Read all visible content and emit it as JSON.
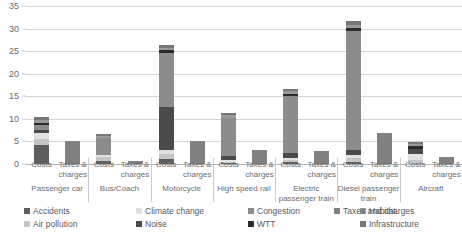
{
  "chart_data": {
    "type": "bar",
    "subtype": "stacked-bar-grouped",
    "title": "",
    "xlabel": "",
    "ylabel": "",
    "ylim": [
      0,
      35
    ],
    "yticks": [
      0,
      5,
      10,
      15,
      20,
      25,
      30,
      35
    ],
    "ytick_labels": [
      "0",
      "5",
      "10",
      "15",
      "20",
      "25",
      "30",
      "35"
    ],
    "grid": true,
    "legend_position": "bottom",
    "bar_sublabels": [
      "Costs",
      "Taxes & charges"
    ],
    "categories": [
      "Passenger car",
      "Bus/Coach",
      "Motorcycle",
      "High speed rail",
      "Electric passenger train",
      "Diesel passenger train",
      "Aircraft"
    ],
    "series": [
      {
        "name": "Accidents",
        "color": "#5e5e5e"
      },
      {
        "name": "Air pollution",
        "color": "#c6c6c6"
      },
      {
        "name": "Climate change",
        "color": "#e2e2e2"
      },
      {
        "name": "Noise",
        "color": "#4a4a4a"
      },
      {
        "name": "Congestion",
        "color": "#8c8c8c"
      },
      {
        "name": "WTT",
        "color": "#2b2b2b"
      },
      {
        "name": "Habitat",
        "color": "#9a9a9a"
      },
      {
        "name": "Infrastructure",
        "color": "#777777"
      },
      {
        "name": "Taxes and charges",
        "color": "#808080"
      }
    ],
    "bars": [
      {
        "category": "Passenger car",
        "kind": "Costs",
        "total": 10.4,
        "stack": [
          {
            "series": "Accidents",
            "value": 4.2
          },
          {
            "series": "Air pollution",
            "value": 1.4
          },
          {
            "series": "Climate change",
            "value": 1.3
          },
          {
            "series": "Noise",
            "value": 0.7
          },
          {
            "series": "Congestion",
            "value": 1.1
          },
          {
            "series": "WTT",
            "value": 0.5
          },
          {
            "series": "Habitat",
            "value": 0.6
          },
          {
            "series": "Infrastructure",
            "value": 0.6
          }
        ]
      },
      {
        "category": "Passenger car",
        "kind": "Taxes & charges",
        "total": 5.2,
        "stack": [
          {
            "series": "Taxes and charges",
            "value": 5.2
          }
        ]
      },
      {
        "category": "Bus/Coach",
        "kind": "Costs",
        "total": 6.7,
        "stack": [
          {
            "series": "Accidents",
            "value": 0.6
          },
          {
            "series": "Air pollution",
            "value": 1.0
          },
          {
            "series": "Climate change",
            "value": 0.5
          },
          {
            "series": "Congestion",
            "value": 3.6
          },
          {
            "series": "Habitat",
            "value": 0.5
          },
          {
            "series": "Infrastructure",
            "value": 0.5
          }
        ]
      },
      {
        "category": "Bus/Coach",
        "kind": "Taxes & charges",
        "total": 0.7,
        "stack": [
          {
            "series": "Taxes and charges",
            "value": 0.7
          }
        ]
      },
      {
        "category": "Motorcycle",
        "kind": "Costs",
        "total": 26.3,
        "stack": [
          {
            "series": "Accidents",
            "value": 1.1
          },
          {
            "series": "Air pollution",
            "value": 1.1
          },
          {
            "series": "Climate change",
            "value": 0.8
          },
          {
            "series": "Noise",
            "value": 9.6
          },
          {
            "series": "Congestion",
            "value": 12.0
          },
          {
            "series": "WTT",
            "value": 0.7
          },
          {
            "series": "Habitat",
            "value": 0.5
          },
          {
            "series": "Infrastructure",
            "value": 0.5
          }
        ]
      },
      {
        "category": "Motorcycle",
        "kind": "Taxes & charges",
        "total": 5.0,
        "stack": [
          {
            "series": "Taxes and charges",
            "value": 5.0
          }
        ]
      },
      {
        "category": "High speed rail",
        "kind": "Costs",
        "total": 11.4,
        "stack": [
          {
            "series": "Accidents",
            "value": 0.2
          },
          {
            "series": "Air pollution",
            "value": 0.3
          },
          {
            "series": "Climate change",
            "value": 0.4
          },
          {
            "series": "Noise",
            "value": 0.8
          },
          {
            "series": "Congestion",
            "value": 8.6
          },
          {
            "series": "Habitat",
            "value": 0.5
          },
          {
            "series": "Infrastructure",
            "value": 0.6
          }
        ]
      },
      {
        "category": "High speed rail",
        "kind": "Taxes & charges",
        "total": 3.1,
        "stack": [
          {
            "series": "Taxes and charges",
            "value": 3.1
          }
        ]
      },
      {
        "category": "Electric passenger train",
        "kind": "Costs",
        "total": 16.6,
        "stack": [
          {
            "series": "Accidents",
            "value": 0.5
          },
          {
            "series": "Air pollution",
            "value": 0.4
          },
          {
            "series": "Climate change",
            "value": 0.5
          },
          {
            "series": "Noise",
            "value": 1.1
          },
          {
            "series": "Congestion",
            "value": 12.6
          },
          {
            "series": "WTT",
            "value": 0.5
          },
          {
            "series": "Habitat",
            "value": 0.5
          },
          {
            "series": "Infrastructure",
            "value": 0.5
          }
        ]
      },
      {
        "category": "Electric passenger train",
        "kind": "Taxes & charges",
        "total": 2.8,
        "stack": [
          {
            "series": "Taxes and charges",
            "value": 2.8
          }
        ]
      },
      {
        "category": "Diesel passenger train",
        "kind": "Costs",
        "total": 31.7,
        "stack": [
          {
            "series": "Accidents",
            "value": 0.5
          },
          {
            "series": "Air pollution",
            "value": 0.8
          },
          {
            "series": "Climate change",
            "value": 0.7
          },
          {
            "series": "Noise",
            "value": 1.1
          },
          {
            "series": "Congestion",
            "value": 26.4
          },
          {
            "series": "WTT",
            "value": 0.7
          },
          {
            "series": "Habitat",
            "value": 0.7
          },
          {
            "series": "Infrastructure",
            "value": 0.8
          }
        ]
      },
      {
        "category": "Diesel passenger train",
        "kind": "Taxes & charges",
        "total": 6.8,
        "stack": [
          {
            "series": "Taxes and charges",
            "value": 6.8
          }
        ]
      },
      {
        "category": "Aircraft",
        "kind": "Costs",
        "total": 4.8,
        "stack": [
          {
            "series": "Air pollution",
            "value": 0.8
          },
          {
            "series": "Climate change",
            "value": 1.5
          },
          {
            "series": "Noise",
            "value": 1.0
          },
          {
            "series": "WTT",
            "value": 0.6
          },
          {
            "series": "Habitat",
            "value": 0.5
          },
          {
            "series": "Infrastructure",
            "value": 0.4
          }
        ]
      },
      {
        "category": "Aircraft",
        "kind": "Taxes & charges",
        "total": 1.5,
        "stack": [
          {
            "series": "Taxes and charges",
            "value": 1.5
          }
        ]
      }
    ],
    "legend": [
      {
        "label": "Accidents",
        "color": "#5e5e5e"
      },
      {
        "label": "Climate change",
        "color": "#e2e2e2"
      },
      {
        "label": "Congestion",
        "color": "#8c8c8c"
      },
      {
        "label": "Habitat",
        "color": "#9a9a9a"
      },
      {
        "label": "Air pollution",
        "color": "#c6c6c6"
      },
      {
        "label": "Noise",
        "color": "#4a4a4a"
      },
      {
        "label": "WTT",
        "color": "#2b2b2b"
      },
      {
        "label": "Infrastructure",
        "color": "#777777"
      },
      {
        "label": "Taxes and charges",
        "color": "#808080"
      }
    ]
  }
}
